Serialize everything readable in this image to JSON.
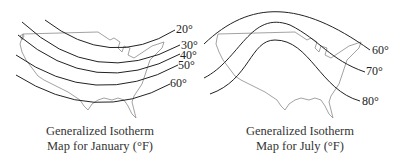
{
  "maps": [
    {
      "id": "january",
      "caption_line1": "Generalized Isotherm",
      "caption_line2": "Map for January (°F)",
      "isotherms": [
        {
          "value": "20°"
        },
        {
          "value": "30°"
        },
        {
          "value": "40°"
        },
        {
          "value": "50°"
        },
        {
          "value": "60°"
        }
      ]
    },
    {
      "id": "july",
      "caption_line1": "Generalized Isotherm",
      "caption_line2": "Map for July (°F)",
      "isotherms": [
        {
          "value": "60°"
        },
        {
          "value": "70°"
        },
        {
          "value": "80°"
        }
      ]
    }
  ],
  "colors": {
    "isotherm_line": "#222222",
    "outline": "#8a8a8a",
    "text": "#333333"
  }
}
